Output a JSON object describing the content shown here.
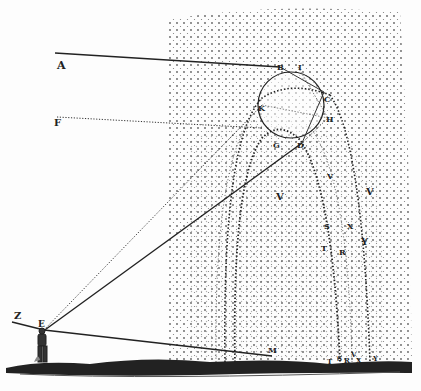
{
  "figure": {
    "colors": {
      "ink": "#222222",
      "dots": "#444444",
      "paper": "#fdfdfd"
    }
  },
  "labels": [
    {
      "id": "A",
      "text": "A",
      "x": 57,
      "y": 60,
      "size": 11
    },
    {
      "id": "F",
      "text": "F",
      "x": 54,
      "y": 118,
      "size": 10
    },
    {
      "id": "B",
      "text": "B",
      "x": 277,
      "y": 63,
      "size": 8
    },
    {
      "id": "I",
      "text": "I",
      "x": 298,
      "y": 63,
      "size": 8
    },
    {
      "id": "C",
      "text": "C",
      "x": 324,
      "y": 95,
      "size": 8
    },
    {
      "id": "K",
      "text": "K",
      "x": 258,
      "y": 104,
      "size": 8
    },
    {
      "id": "H",
      "text": "H",
      "x": 326,
      "y": 115,
      "size": 8
    },
    {
      "id": "G",
      "text": "G",
      "x": 273,
      "y": 141,
      "size": 8
    },
    {
      "id": "D",
      "text": "D",
      "x": 297,
      "y": 141,
      "size": 8
    },
    {
      "id": "V1",
      "text": "V",
      "x": 327,
      "y": 172,
      "size": 8
    },
    {
      "id": "V2",
      "text": "V",
      "x": 276,
      "y": 192,
      "size": 10
    },
    {
      "id": "V3",
      "text": "V",
      "x": 366,
      "y": 187,
      "size": 10
    },
    {
      "id": "S",
      "text": "S",
      "x": 324,
      "y": 222,
      "size": 8
    },
    {
      "id": "X",
      "text": "X",
      "x": 347,
      "y": 222,
      "size": 8
    },
    {
      "id": "T",
      "text": "T",
      "x": 321,
      "y": 244,
      "size": 8
    },
    {
      "id": "R",
      "text": "R",
      "x": 339,
      "y": 248,
      "size": 8
    },
    {
      "id": "Y",
      "text": "Y",
      "x": 361,
      "y": 237,
      "size": 10
    },
    {
      "id": "Z",
      "text": "Z",
      "x": 14,
      "y": 311,
      "size": 10
    },
    {
      "id": "E",
      "text": "E",
      "x": 38,
      "y": 320,
      "size": 9
    },
    {
      "id": "M",
      "text": "M",
      "x": 268,
      "y": 346,
      "size": 8
    },
    {
      "id": "Tg",
      "text": "T",
      "x": 327,
      "y": 358,
      "size": 7
    },
    {
      "id": "Sg",
      "text": "S",
      "x": 337,
      "y": 355,
      "size": 7
    },
    {
      "id": "Rg",
      "text": "R",
      "x": 344,
      "y": 357,
      "size": 7
    },
    {
      "id": "Vg",
      "text": "V",
      "x": 351,
      "y": 351,
      "size": 7
    },
    {
      "id": "Xg",
      "text": "X",
      "x": 356,
      "y": 357,
      "size": 7
    },
    {
      "id": "Yg",
      "text": "Y",
      "x": 373,
      "y": 355,
      "size": 7
    }
  ]
}
